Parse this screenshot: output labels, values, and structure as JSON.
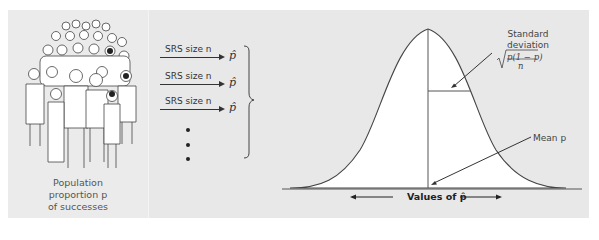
{
  "figure": {
    "population": {
      "label_line1": "Population",
      "label_line2": "proportion p",
      "label_line3": "of successes",
      "image": "crowd-of-people-illustration"
    },
    "samples": [
      {
        "label": "SRS size n",
        "result": "p̂"
      },
      {
        "label": "SRS size n",
        "result": "p̂"
      },
      {
        "label": "SRS size n",
        "result": "p̂"
      }
    ],
    "ellipsis": "vertical-dots",
    "distribution": {
      "type": "normal-curve",
      "sd_label_line1": "Standard",
      "sd_label_line2": "deviation",
      "sd_formula": "√(p(1 − p)/n)",
      "sd_formula_num": "p(1 − p)",
      "sd_formula_den": "n",
      "mean_label": "Mean p",
      "axis_label": "Values of p̂"
    },
    "colors": {
      "panel_bg": "#e8e8e8",
      "curve_fill": "#ffffff",
      "line": "#333333"
    }
  }
}
